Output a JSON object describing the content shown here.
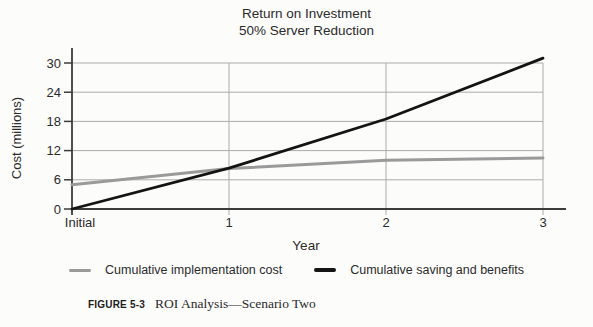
{
  "title": {
    "line1": "Return on Investment",
    "line2": "50% Server Reduction"
  },
  "chart_data": {
    "type": "line",
    "categories": [
      "Initial",
      "1",
      "2",
      "3"
    ],
    "series": [
      {
        "name": "Cumulative implementation cost",
        "color": "#9a9a9a",
        "values": [
          5,
          8.3,
          10,
          10.5
        ]
      },
      {
        "name": "Cumulative saving and benefits",
        "color": "#141414",
        "values": [
          0,
          8.4,
          18.5,
          31
        ]
      }
    ],
    "xlabel": "Year",
    "ylabel": "Cost (millions)",
    "ylim": [
      0,
      30
    ],
    "yticks": [
      0,
      6,
      12,
      18,
      24,
      30
    ],
    "grid": true,
    "legend_position": "bottom",
    "grid_color": "#ababab",
    "axis_color": "#3c3c3c",
    "text_color": "#2b2b2b"
  },
  "caption": {
    "label": "FIGURE 5-3",
    "text": "ROI Analysis—Scenario Two"
  }
}
